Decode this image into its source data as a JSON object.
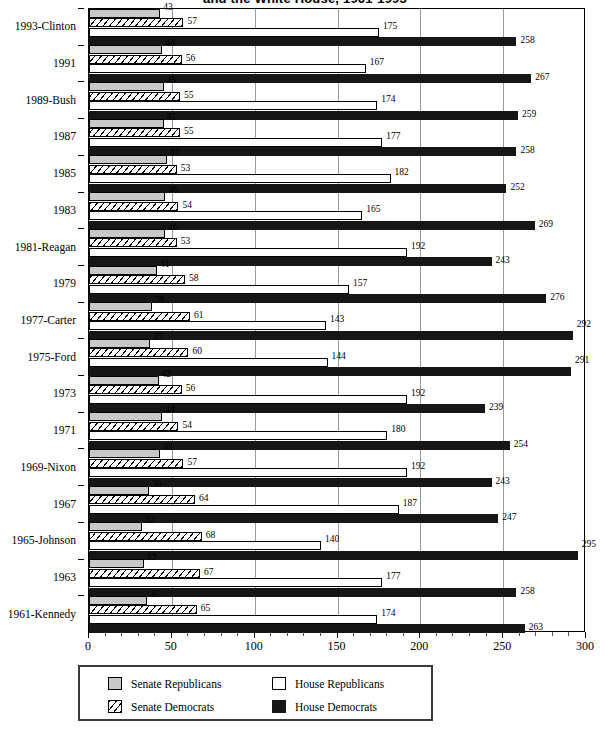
{
  "chart_data": {
    "type": "bar",
    "orientation": "horizontal",
    "title": "and the White House, 1961-1993",
    "xlabel": "",
    "ylabel": "",
    "xlim": [
      0,
      300
    ],
    "xticks": [
      0,
      50,
      100,
      150,
      200,
      250,
      300
    ],
    "xtick_labels": [
      "0",
      "50",
      "100",
      "150",
      "200",
      "250",
      "300"
    ],
    "minor_tick_step": 10,
    "grid": "vertical",
    "legend_position": "bottom",
    "categories": [
      "1993-Clinton",
      "1991",
      "1989-Bush",
      "1987",
      "1985",
      "1983",
      "1981-Reagan",
      "1979",
      "1977-Carter",
      "1975-Ford",
      "1973",
      "1971",
      "1969-Nixon",
      "1967",
      "1965-Johnson",
      "1963",
      "1961-Kennedy"
    ],
    "series": [
      {
        "name": "Senate Republicans",
        "key": "senate-rep",
        "color": "#c8c8c8",
        "pattern": "solid-gray",
        "values": [
          43,
          44,
          45,
          45,
          47,
          46,
          46,
          41,
          38,
          37,
          42,
          44,
          43,
          36,
          32,
          33,
          35
        ]
      },
      {
        "name": "Senate Democrats",
        "key": "senate-dem",
        "color": "#ffffff",
        "pattern": "diagonal-hatch",
        "values": [
          57,
          56,
          55,
          55,
          53,
          54,
          53,
          58,
          61,
          60,
          56,
          54,
          57,
          64,
          68,
          67,
          65
        ]
      },
      {
        "name": "House Republicans",
        "key": "house-rep",
        "color": "#ffffff",
        "pattern": "solid-white",
        "values": [
          175,
          167,
          174,
          177,
          182,
          165,
          192,
          157,
          143,
          144,
          192,
          180,
          192,
          187,
          140,
          177,
          174
        ]
      },
      {
        "name": "House Democrats",
        "key": "house-dem",
        "color": "#161616",
        "pattern": "solid-black",
        "values": [
          258,
          267,
          259,
          258,
          252,
          269,
          243,
          276,
          292,
          291,
          239,
          254,
          243,
          247,
          295,
          258,
          263
        ]
      }
    ]
  },
  "legend": {
    "entries": [
      {
        "label": "Senate Republicans",
        "key": "senate-rep"
      },
      {
        "label": "House Republicans",
        "key": "house-rep"
      },
      {
        "label": "Senate Democrats",
        "key": "senate-dem"
      },
      {
        "label": "House Democrats",
        "key": "house-dem"
      }
    ]
  }
}
